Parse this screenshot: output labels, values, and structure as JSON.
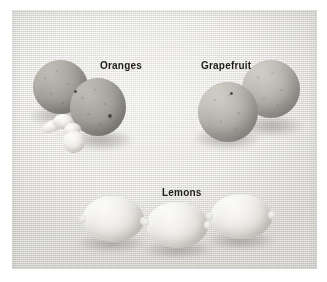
{
  "image": {
    "kind": "photograph",
    "subject": "Citrus fruit varieties on woven cloth",
    "rendering": "black-and-white",
    "alt_text": "Black and white photograph of citrus fruit arranged on textured cloth: two oranges with peeled segments, two grapefruit, and three lemons.",
    "background_color": "#eceae6",
    "surround_color": "#ffffff",
    "label_color": "#1d1c1a"
  },
  "labels": {
    "oranges": "Oranges",
    "grapefruit": "Grapefruit",
    "lemons": "Lemons"
  },
  "groups": [
    {
      "name": "oranges",
      "label": "Oranges",
      "count": 2,
      "extras": "peeled segments and rind"
    },
    {
      "name": "grapefruit",
      "label": "Grapefruit",
      "count": 2,
      "extras": ""
    },
    {
      "name": "lemons",
      "label": "Lemons",
      "count": 3,
      "extras": ""
    }
  ]
}
